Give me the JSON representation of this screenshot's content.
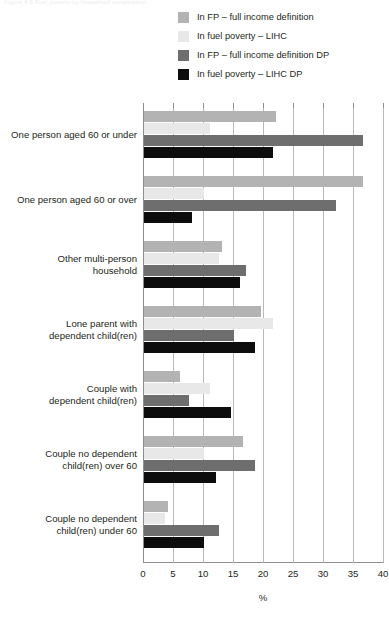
{
  "top_fragment": "Figure 4.6  Fuel poverty by household composition",
  "chart_data": {
    "type": "bar",
    "orientation": "horizontal",
    "title": "",
    "xlabel": "%",
    "ylabel": "",
    "xlim": [
      0,
      40
    ],
    "xticks": [
      0,
      5,
      10,
      15,
      20,
      25,
      30,
      35,
      40
    ],
    "grid": true,
    "legend_position": "top-right",
    "categories": [
      "One person aged 60 or under",
      "One person aged 60 or over",
      "Other multi-person household",
      "Lone parent with dependent child(ren)",
      "Couple with dependent child(ren)",
      "Couple no dependent child(ren) over 60",
      "Couple no dependent child(ren) under 60"
    ],
    "series": [
      {
        "name": "In FP – full income definition",
        "color": "#b3b3b3",
        "values": [
          22.0,
          36.5,
          13.0,
          19.5,
          6.0,
          16.5,
          4.0
        ]
      },
      {
        "name": "In fuel poverty – LIHC",
        "color": "#e8e8e8",
        "values": [
          11.0,
          10.0,
          12.5,
          21.5,
          11.0,
          10.0,
          3.5
        ]
      },
      {
        "name": "In FP – full income definition DP",
        "color": "#6e6e6e",
        "values": [
          36.5,
          32.0,
          17.0,
          15.0,
          7.5,
          18.5,
          12.5
        ]
      },
      {
        "name": "In fuel poverty – LIHC  DP",
        "color": "#0d0d0d",
        "values": [
          21.5,
          8.0,
          16.0,
          18.5,
          14.5,
          12.0,
          10.0
        ]
      }
    ]
  },
  "category_lines": [
    [
      "One person aged 60 or under"
    ],
    [
      "One person aged 60 or over"
    ],
    [
      "Other multi-person",
      "household"
    ],
    [
      "Lone parent with",
      "dependent child(ren)"
    ],
    [
      "Couple with",
      "dependent child(ren)"
    ],
    [
      "Couple no dependent",
      "child(ren) over 60"
    ],
    [
      "Couple no dependent",
      "child(ren) under 60"
    ]
  ]
}
